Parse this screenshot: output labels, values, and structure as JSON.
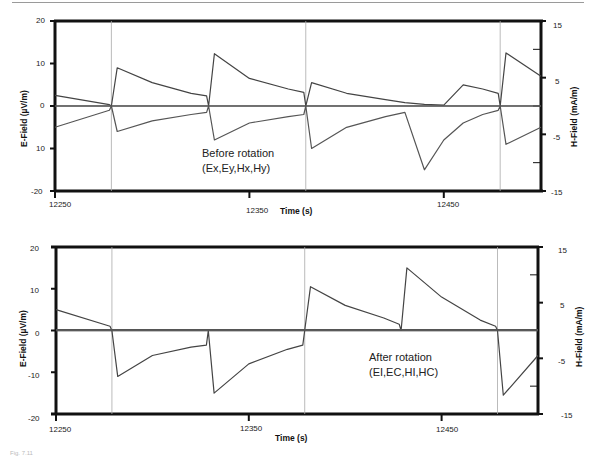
{
  "figure": {
    "caption": "Fig. 7.11"
  },
  "chart_data": [
    {
      "type": "line",
      "panel": "top",
      "title": "",
      "annotation": [
        "Before rotation",
        "(Ex,Ey,Hx,Hy)"
      ],
      "xlabel": "Time (s)",
      "ylabel_left": "E-Field (µV/m)",
      "ylabel_right": "H-Field (mA/m)",
      "xlim": [
        12250,
        12500
      ],
      "xticks": [
        12250,
        12350,
        12450
      ],
      "ylim_left": [
        -20,
        20
      ],
      "yticks_left": [
        "20",
        "10",
        "0",
        "10",
        "-20"
      ],
      "ylim_right": [
        -15,
        15
      ],
      "yticks_right": [
        "15",
        "5",
        "-5",
        "-15"
      ],
      "grid": false,
      "vlines": [
        12279,
        12379,
        12479
      ],
      "series": [
        {
          "name": "Ex",
          "x": [
            12250,
            12278,
            12279,
            12282,
            12300,
            12320,
            12328,
            12329,
            12332,
            12350,
            12370,
            12378,
            12379,
            12382,
            12400,
            12420,
            12430,
            12440,
            12450,
            12460,
            12470,
            12478,
            12479,
            12482,
            12500
          ],
          "y": [
            2.5,
            0.3,
            0,
            9,
            5.5,
            3,
            2.4,
            0,
            12.3,
            6.5,
            4,
            3.2,
            0,
            5.5,
            3,
            1.5,
            0.8,
            0.4,
            0.2,
            5,
            4,
            3,
            0,
            12.5,
            7
          ]
        },
        {
          "name": "Ey",
          "x": [
            12250,
            12278,
            12279,
            12282,
            12300,
            12320,
            12328,
            12329,
            12332,
            12350,
            12370,
            12378,
            12379,
            12382,
            12400,
            12420,
            12430,
            12440,
            12450,
            12460,
            12470,
            12478,
            12479,
            12482,
            12500
          ],
          "y": [
            -5,
            -1,
            0,
            -6,
            -3.5,
            -2,
            -1.5,
            0,
            -8,
            -4,
            -2.5,
            -2,
            0,
            -10,
            -5,
            -2.5,
            -1.5,
            -15,
            -8,
            -4,
            -2,
            -1,
            0,
            -9,
            -5
          ]
        },
        {
          "name": "Hx",
          "x": [
            12250,
            12500
          ],
          "y": [
            0.1,
            0.1
          ]
        },
        {
          "name": "Hy",
          "x": [
            12250,
            12500
          ],
          "y": [
            -0.1,
            -0.1
          ]
        }
      ]
    },
    {
      "type": "line",
      "panel": "bottom",
      "title": "",
      "annotation": [
        "After rotation",
        "(EI,EC,HI,HC)"
      ],
      "xlabel": "Time (s)",
      "ylabel_left": "E-Field (µV/m)",
      "ylabel_right": "H-Field (mA/m)",
      "xlim": [
        12250,
        12500
      ],
      "xticks": [
        12250,
        12350,
        12450
      ],
      "ylim_left": [
        -20,
        20
      ],
      "yticks_left": [
        "20",
        "10",
        "0",
        "-10",
        "-20"
      ],
      "ylim_right": [
        -15,
        15
      ],
      "yticks_right": [
        "15",
        "5",
        "-5",
        "-15"
      ],
      "grid": false,
      "vlines": [
        12279,
        12379,
        12479
      ],
      "series": [
        {
          "name": "EI",
          "x": [
            12250,
            12278,
            12279,
            12282,
            12300,
            12320,
            12328,
            12329,
            12332,
            12350,
            12370,
            12378,
            12379,
            12382,
            12400,
            12420,
            12428,
            12429,
            12432,
            12450,
            12470,
            12478,
            12479,
            12482,
            12500
          ],
          "y": [
            5,
            1,
            0,
            -11,
            -6,
            -4,
            -3.5,
            0,
            -15,
            -8,
            -4.5,
            -3.5,
            0,
            10.5,
            6,
            3,
            1.5,
            0,
            15,
            8,
            2.5,
            1,
            0,
            -15.5,
            -6
          ]
        },
        {
          "name": "EC",
          "x": [
            12250,
            12500
          ],
          "y": [
            0.2,
            0.2
          ]
        },
        {
          "name": "HI",
          "x": [
            12250,
            12500
          ],
          "y": [
            0,
            0
          ]
        },
        {
          "name": "HC",
          "x": [
            12250,
            12500
          ],
          "y": [
            -0.1,
            -0.1
          ]
        }
      ]
    }
  ]
}
